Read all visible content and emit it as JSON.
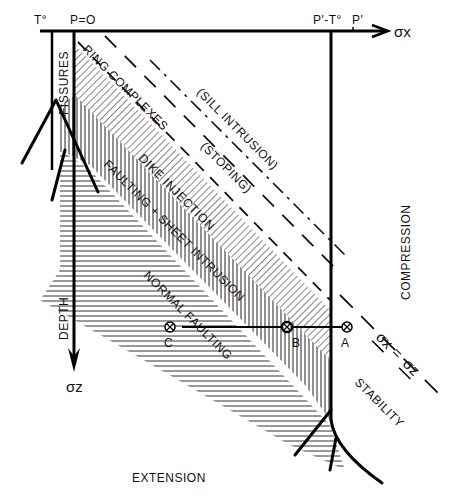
{
  "diagram": {
    "type": "stress-field diagram (horizontal stress vs depth)",
    "axes": {
      "x_label": "σx",
      "y_label": "σz",
      "y_axis_title": "DEPTH",
      "top_ticks": [
        "T°",
        "P=O",
        "P'-T°",
        "P'"
      ]
    },
    "regions": {
      "fissures": "FISSURES",
      "ring_complexes": "RING COMPLEXES",
      "sill_intrusion": "(SILL INTRUSION)",
      "stoping": "(STOPING)",
      "dike_injection": "DIKE INJECTION",
      "faulting_sheet": "FAULTING + SHEET INTRUSION",
      "normal_faulting": "NORMAL FAULTING",
      "compression": "COMPRESSION",
      "stability": "STABILITY",
      "extension": "EXTENSION"
    },
    "equation": {
      "left": "σx",
      "eq": "=",
      "right": "σz"
    },
    "points": [
      {
        "label": "C"
      },
      {
        "label": "B"
      },
      {
        "label": "A"
      }
    ]
  }
}
